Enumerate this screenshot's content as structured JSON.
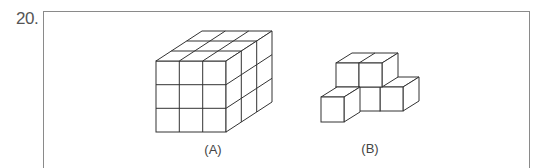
{
  "question": {
    "number": "20."
  },
  "figures": [
    {
      "id": "A",
      "label": "(A)",
      "description": "3x3x3 cube made of 27 unit cubes"
    },
    {
      "id": "B",
      "label": "(B)",
      "description": "block shape: back row of 3 cubes with 2 cubes stacked on top of left two, plus 1 cube in front-left"
    }
  ],
  "colors": {
    "line": "#333333",
    "frame": "#8a8a8a",
    "text": "#444444"
  }
}
